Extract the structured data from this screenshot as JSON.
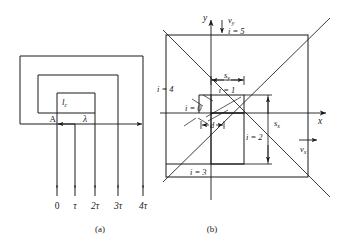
{
  "figure": {
    "caption_a": "(a)",
    "caption_b": "(b)"
  },
  "panel_a": {
    "label_A": "A",
    "label_lc": "l",
    "label_lc_sub": "c",
    "label_lambda": "λ",
    "axis_ticks": [
      "0",
      "τ",
      "2τ",
      "3τ",
      "4τ"
    ]
  },
  "panel_b": {
    "axis_y": "y",
    "axis_x": "x",
    "vy_label": "v",
    "vy_sub": "y",
    "vx_label": "v",
    "vx_sub": "x",
    "sy_label": "s",
    "sy_sub": "y",
    "sx_label": "s",
    "sx_sub": "x",
    "d_label": "d",
    "indices": [
      {
        "text": "i = 5"
      },
      {
        "text": "i = 4"
      },
      {
        "text": "i = 0"
      },
      {
        "text": "i = 1"
      },
      {
        "text": "i = 2"
      },
      {
        "text": "i = 3"
      }
    ]
  },
  "colors": {
    "line": "#1a1a1a",
    "background": "#ffffff"
  }
}
